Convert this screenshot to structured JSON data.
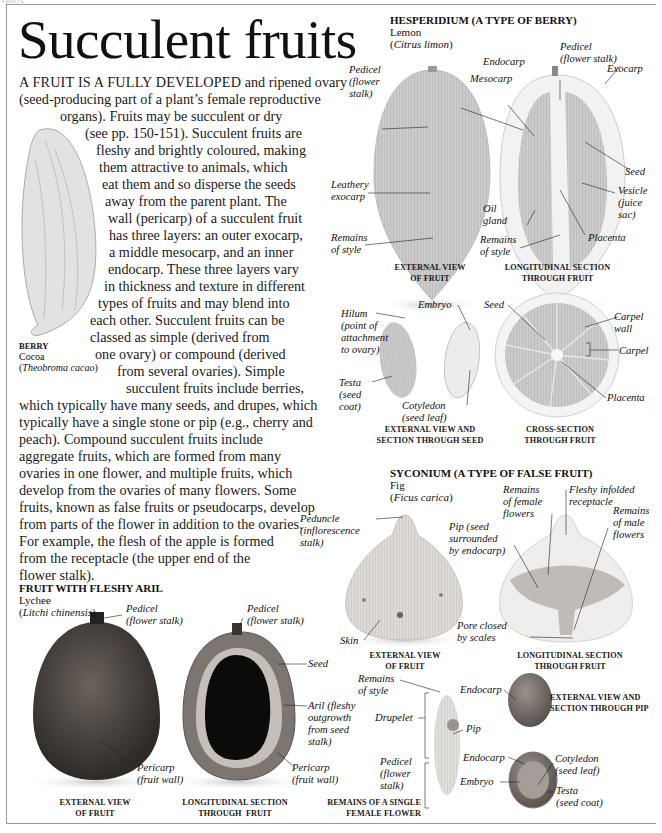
{
  "page": {
    "corner_tag": "FRUITS",
    "title": "Succulent fruits"
  },
  "intro": {
    "lines": [
      {
        "lead": "A FRUIT IS A FULLY DEVELOPED",
        "text": " and ripened ovary"
      },
      {
        "text": "(seed-producing part of a plant’s female reproductive"
      },
      {
        "text": "organs). Fruits may be succulent or dry"
      },
      {
        "text": "(see pp. 150-151). Succulent fruits are"
      },
      {
        "text": "fleshy and brightly coloured, making"
      },
      {
        "text": "them attractive to animals, which"
      },
      {
        "text": "eat them and so disperse the seeds"
      },
      {
        "text": "away from the parent plant. The"
      },
      {
        "text": "wall (pericarp) of a succulent fruit"
      },
      {
        "text": "has three layers: an outer exocarp,"
      },
      {
        "text": "a middle mesocarp, and an inner"
      },
      {
        "text": "endocarp. These three layers vary"
      },
      {
        "text": "in thickness and texture in different"
      },
      {
        "text": "types of fruits and may blend into"
      },
      {
        "text": "each other. Succulent fruits can be"
      },
      {
        "text": "classed as simple (derived from"
      },
      {
        "text": "one ovary) or compound (derived"
      },
      {
        "text": "from several ovaries). Simple"
      },
      {
        "text": "succulent fruits include berries,"
      },
      {
        "text": "which typically have many seeds, and drupes, which"
      },
      {
        "text": "typically have a single stone or pip (e.g., cherry and"
      },
      {
        "text": "peach). Compound succulent fruits include"
      },
      {
        "text": "aggregate fruits, which are formed from many"
      },
      {
        "text": "ovaries in one flower, and multiple fruits, which"
      },
      {
        "text": "develop from the ovaries of many flowers. Some"
      },
      {
        "text": "fruits, known as false fruits or pseudocarps, develop"
      },
      {
        "text": "from parts of the flower in addition to the ovaries."
      },
      {
        "text": "For example, the flesh of the apple is formed"
      },
      {
        "text": "from the receptacle (the upper end of the"
      },
      {
        "text": "flower stalk)."
      }
    ]
  },
  "berry": {
    "heading": "BERRY",
    "common": "Cocoa",
    "latin": "Theobroma cacao"
  },
  "hesperidium": {
    "heading": "HESPERIDIUM (A TYPE OF BERRY)",
    "common": "Lemon",
    "latin": "Citrus limon",
    "external": {
      "caption": [
        "EXTERNAL VIEW",
        "OF FRUIT"
      ],
      "labels": {
        "pedicel": [
          "Pedicel",
          "(flower",
          "stalk)"
        ],
        "exocarp": [
          "Leathery",
          "exocarp"
        ],
        "style": [
          "Remains",
          "of style"
        ]
      }
    },
    "longitudinal": {
      "caption": [
        "LONGITUDINAL SECTION",
        "THROUGH FRUIT"
      ],
      "labels": {
        "endocarp": "Endocarp",
        "pedicel": [
          "Pedicel",
          "(flower stalk)"
        ],
        "exocarp": "Exocarp",
        "mesocarp": "Mesocarp",
        "seed": "Seed",
        "vesicle": [
          "Vesicle",
          "(juice",
          "sac)"
        ],
        "oil_gland": [
          "Oil",
          "gland"
        ],
        "style": [
          "Remains",
          "of style"
        ],
        "placenta": "Placenta"
      }
    },
    "seed": {
      "caption": [
        "EXTERNAL VIEW AND",
        "SECTION THROUGH SEED"
      ],
      "labels": {
        "hilum": [
          "Hilum",
          "(point of",
          "attachment",
          "to ovary)"
        ],
        "embryo": "Embryo",
        "testa": [
          "Testa",
          "(seed",
          "coat)"
        ],
        "cotyledon": [
          "Cotyledon",
          "(seed leaf)"
        ]
      }
    },
    "cross": {
      "caption": [
        "CROSS-SECTION",
        "THROUGH FRUIT"
      ],
      "labels": {
        "seed": "Seed",
        "carpel_wall": [
          "Carpel",
          "wall"
        ],
        "carpel": "Carpel",
        "placenta": "Placenta"
      }
    }
  },
  "syconium": {
    "heading": "SYCONIUM (A TYPE OF FALSE FRUIT)",
    "common": "Fig",
    "latin": "Ficus carica",
    "external": {
      "caption": [
        "EXTERNAL VIEW",
        "OF FRUIT"
      ],
      "labels": {
        "peduncle": [
          "Peduncle",
          "(inflorescence",
          "stalk)"
        ],
        "skin": "Skin"
      }
    },
    "longitudinal": {
      "caption": [
        "LONGITUDINAL SECTION",
        "THROUGH FRUIT"
      ],
      "labels": {
        "female": [
          "Remains",
          "of female",
          "flowers"
        ],
        "receptacle": [
          "Fleshy infolded",
          "receptacle"
        ],
        "male": [
          "Remains",
          "of male",
          "flowers"
        ],
        "pip": [
          "Pip (seed",
          "surrounded",
          "by endocarp)"
        ],
        "pore": [
          "Pore closed",
          "by scales"
        ]
      }
    },
    "flower": {
      "caption": [
        "REMAINS OF A SINGLE",
        "FEMALE FLOWER"
      ],
      "labels": {
        "style": [
          "Remains",
          "of style"
        ],
        "drupelet": "Drupelet",
        "pip": "Pip",
        "pedicel": [
          "Pedicel",
          "(flower",
          "stalk)"
        ]
      }
    },
    "pip_view": {
      "caption": [
        "EXTERNAL VIEW AND",
        "SECTION THROUGH PIP"
      ],
      "labels": {
        "endocarp_top": "Endocarp",
        "endocarp": "Endocarp",
        "cotyledon": [
          "Cotyledon",
          "(seed leaf)"
        ],
        "embryo": "Embryo",
        "testa": [
          "Testa",
          "(seed coat)"
        ]
      }
    }
  },
  "aril": {
    "heading": "FRUIT WITH FLESHY ARIL",
    "common": "Lychee",
    "latin": "Litchi chinensis",
    "external": {
      "caption": [
        "EXTERNAL VIEW",
        "OF FRUIT"
      ],
      "labels": {
        "pedicel": [
          "Pedicel",
          "(flower stalk)"
        ],
        "pericarp": [
          "Pericarp",
          "(fruit wall)"
        ]
      }
    },
    "longitudinal": {
      "caption": [
        "LONGITUDINAL SECTION",
        "THROUGH  FRUIT"
      ],
      "labels": {
        "pedicel": [
          "Pedicel",
          "(flower stalk)"
        ],
        "seed": "Seed",
        "aril": [
          "Aril (fleshy",
          "outgrowth",
          "from seed",
          "stalk)"
        ],
        "pericarp": [
          "Pericarp",
          "(fruit wall)"
        ]
      }
    }
  },
  "colors": {
    "frame": "#9a9a9a",
    "text": "#1a1a1a",
    "lemon": "#c9c9c9",
    "lychee_skin": "#4a4440",
    "lychee_seed": "#0d0a0a",
    "fig": "#d8d4cf"
  }
}
